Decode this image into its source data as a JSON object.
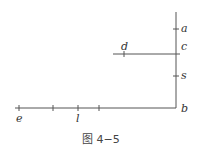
{
  "figure": {
    "caption": "图 4−5",
    "line_color": "#555555"
  },
  "labels": {
    "a": "a",
    "c": "c",
    "d": "d",
    "s": "s",
    "b": "b",
    "e": "e",
    "l": "l"
  },
  "geometry": {
    "vertical_line": {
      "x": 176,
      "y1": 12,
      "y2": 108,
      "ticks_y": [
        29,
        76
      ]
    },
    "horizontal_upper": {
      "y": 54,
      "x1": 113,
      "x2": 180,
      "ticks_x": [
        124
      ]
    },
    "horizontal_lower": {
      "y": 108,
      "x1": 15,
      "x2": 176,
      "ticks_x": [
        19,
        53,
        78,
        99
      ]
    }
  }
}
